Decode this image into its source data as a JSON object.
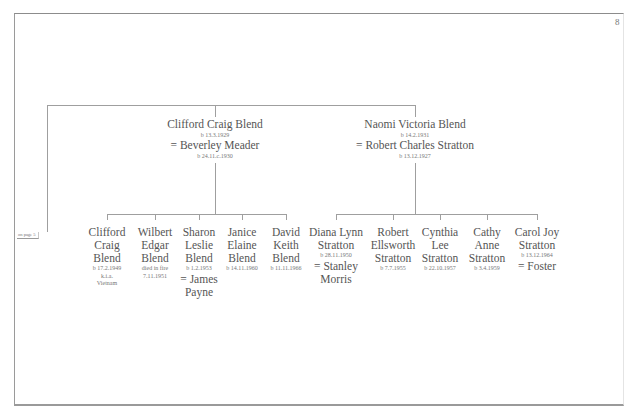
{
  "page": {
    "page_number": "8",
    "cross_reference": "on page 5"
  },
  "parents": [
    {
      "name": "Clifford Craig Blend",
      "born": "b 13.3.1929",
      "spouse": "= Beverley Meader",
      "spouse_born": "b 24.11.c.1930"
    },
    {
      "name": "Naomi Victoria Blend",
      "born": "b 14.2.1931",
      "spouse": "= Robert Charles Stratton",
      "spouse_born": "b 13.12.1927"
    }
  ],
  "blend_children": [
    {
      "name_lines": [
        "Clifford",
        "Craig",
        "Blend"
      ],
      "details": [
        "b 17.2.1949",
        "k.i.a.",
        "Vietnam"
      ],
      "spouse_lines": []
    },
    {
      "name_lines": [
        "Wilbert",
        "Edgar",
        "Blend"
      ],
      "details": [
        "died in fire",
        "7.11.1951"
      ],
      "spouse_lines": []
    },
    {
      "name_lines": [
        "Sharon",
        "Leslie",
        "Blend"
      ],
      "details": [
        "b 1.2.1953"
      ],
      "spouse_lines": [
        "= James",
        "Payne"
      ]
    },
    {
      "name_lines": [
        "Janice",
        "Elaine",
        "Blend"
      ],
      "details": [
        "b 14.11.1960"
      ],
      "spouse_lines": []
    },
    {
      "name_lines": [
        "David",
        "Keith",
        "Blend"
      ],
      "details": [
        "b 11.11.1966"
      ],
      "spouse_lines": []
    }
  ],
  "stratton_children": [
    {
      "name_lines": [
        "Diana Lynn",
        "Stratton"
      ],
      "details": [
        "b 28.11.1950"
      ],
      "spouse_lines": [
        "= Stanley",
        "Morris"
      ]
    },
    {
      "name_lines": [
        "Robert",
        "Ellsworth",
        "Stratton"
      ],
      "details": [
        "b 7.7.1955"
      ],
      "spouse_lines": []
    },
    {
      "name_lines": [
        "Cynthia",
        "Lee",
        "Stratton"
      ],
      "details": [
        "b 22.10.1957"
      ],
      "spouse_lines": []
    },
    {
      "name_lines": [
        "Cathy",
        "Anne",
        "Stratton"
      ],
      "details": [
        "b 3.4.1959"
      ],
      "spouse_lines": []
    },
    {
      "name_lines": [
        "Carol Joy",
        "Stratton"
      ],
      "details": [
        "b 13.12.1964"
      ],
      "spouse_lines": [
        "= Foster"
      ]
    }
  ]
}
